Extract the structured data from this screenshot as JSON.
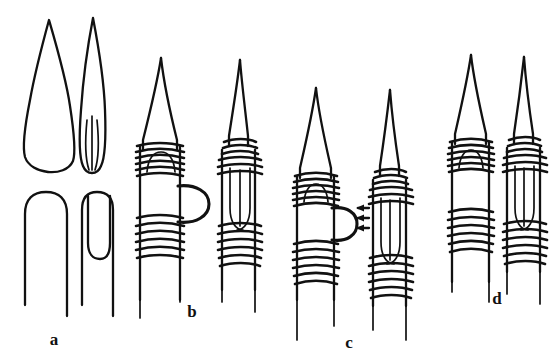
{
  "figure": {
    "kind": "line-art scientific diagram",
    "background_color": "#ffffff",
    "ink_color": "#111111",
    "width": 553,
    "height": 364,
    "panel_count": 4
  },
  "panels": [
    {
      "id": "a",
      "label": "a",
      "label_x": 54,
      "label_y": 345,
      "description": "Two pairs of uncoiled outlines: upper row shows two lanceolate (teardrop) closed outlines, the right one narrower with an internal median slit line; lower row shows two open inverted-U hairpin outlines, the right one containing a narrower inner hairpin.",
      "elements": [
        {
          "name": "wide-lanceolate-outline",
          "position": "upper-left"
        },
        {
          "name": "narrow-lanceolate-outline-with-slit",
          "position": "upper-right"
        },
        {
          "name": "wide-hairpin-outline",
          "position": "lower-left"
        },
        {
          "name": "narrow-hairpin-outline-nested",
          "position": "lower-right"
        }
      ]
    },
    {
      "id": "b",
      "label": "b",
      "label_x": 192,
      "label_y": 317,
      "description": "Pair of coiled structures. Left: tapered apex over a cylindrical body bearing two bands of helical coils, with an external rounded loop protruding to the right between the bands. Right: same structure with the loop retracted and enclosed inside the coiled cylinder.",
      "elements": [
        {
          "name": "coiled-structure-loop-external",
          "position": "left"
        },
        {
          "name": "coiled-structure-loop-internal",
          "position": "right"
        },
        {
          "name": "protruding-loop",
          "position": "left-structure-right-side"
        }
      ]
    },
    {
      "id": "c",
      "label": "c",
      "label_x": 349,
      "label_y": 348,
      "description": "Pair of coiled structures like panel b but positioned lower; the left structure's external protruding loop is marked by three short arrows pointing left toward it. Right structure has the loop enclosed internally.",
      "elements": [
        {
          "name": "coiled-structure-loop-external",
          "position": "left"
        },
        {
          "name": "coiled-structure-loop-internal",
          "position": "right"
        },
        {
          "name": "protruding-loop",
          "position": "left-structure-right-side"
        },
        {
          "name": "annotation-arrow",
          "count": 3,
          "direction": "left"
        }
      ],
      "annotation": {
        "arrow_count": 3,
        "arrow_direction": "left",
        "points_to": "protruding-loop"
      }
    },
    {
      "id": "d",
      "label": "d",
      "label_x": 497,
      "label_y": 304,
      "description": "Pair of coiled structures shown without an external loop. Left: broader tapered apex with two coil bands over a plain cylindrical body. Right: narrower structure with an elongated internal loop visible inside the coiled cylinder.",
      "elements": [
        {
          "name": "coiled-structure-plain",
          "position": "left"
        },
        {
          "name": "coiled-structure-loop-internal",
          "position": "right"
        }
      ]
    }
  ],
  "labels": {
    "a": "a",
    "b": "b",
    "c": "c",
    "d": "d"
  }
}
